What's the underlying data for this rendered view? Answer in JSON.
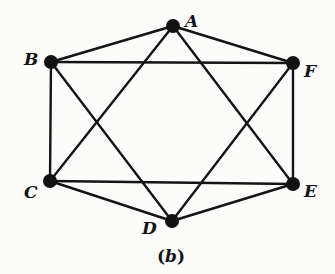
{
  "diagram": {
    "type": "graph",
    "caption": {
      "open": "(",
      "letter": "b",
      "close": ")"
    },
    "vertices": [
      {
        "id": "A",
        "label": "A",
        "x": 173,
        "y": 26,
        "label_x": 185,
        "label_y": 27
      },
      {
        "id": "B",
        "label": "B",
        "x": 51,
        "y": 62,
        "label_x": 24,
        "label_y": 65
      },
      {
        "id": "F",
        "label": "F",
        "x": 293,
        "y": 63,
        "label_x": 304,
        "label_y": 77
      },
      {
        "id": "C",
        "label": "C",
        "x": 50,
        "y": 181,
        "label_x": 24,
        "label_y": 198
      },
      {
        "id": "E",
        "label": "E",
        "x": 293,
        "y": 184,
        "label_x": 304,
        "label_y": 197
      },
      {
        "id": "D",
        "label": "D",
        "x": 172,
        "y": 221,
        "label_x": 142,
        "label_y": 234
      }
    ],
    "edges": [
      [
        "A",
        "B"
      ],
      [
        "A",
        "F"
      ],
      [
        "A",
        "C"
      ],
      [
        "A",
        "E"
      ],
      [
        "B",
        "F"
      ],
      [
        "B",
        "C"
      ],
      [
        "B",
        "D"
      ],
      [
        "F",
        "E"
      ],
      [
        "F",
        "D"
      ],
      [
        "C",
        "E"
      ],
      [
        "C",
        "D"
      ],
      [
        "E",
        "D"
      ]
    ],
    "colors": {
      "line": "#141414",
      "node": "#111111",
      "background": "#fcfcfa"
    }
  }
}
